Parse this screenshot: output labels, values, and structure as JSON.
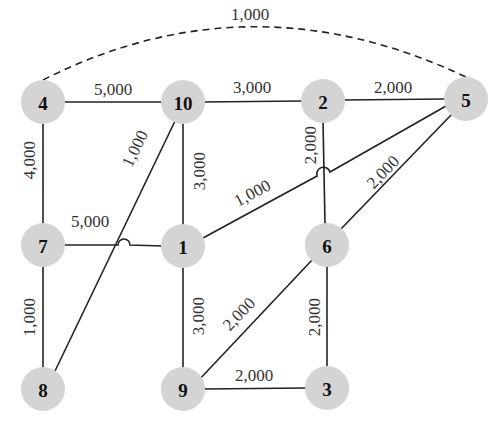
{
  "diagram": {
    "title": "",
    "node_color": "#d4d4d4",
    "nodes": [
      {
        "id": "4",
        "label": "4",
        "x": 43,
        "y": 102
      },
      {
        "id": "10",
        "label": "10",
        "x": 183,
        "y": 102
      },
      {
        "id": "2",
        "label": "2",
        "x": 323,
        "y": 101
      },
      {
        "id": "5",
        "label": "5",
        "x": 466,
        "y": 99
      },
      {
        "id": "7",
        "label": "7",
        "x": 43,
        "y": 245
      },
      {
        "id": "1",
        "label": "1",
        "x": 183,
        "y": 246
      },
      {
        "id": "6",
        "label": "6",
        "x": 327,
        "y": 245
      },
      {
        "id": "8",
        "label": "8",
        "x": 43,
        "y": 389
      },
      {
        "id": "9",
        "label": "9",
        "x": 183,
        "y": 389
      },
      {
        "id": "3",
        "label": "3",
        "x": 327,
        "y": 388
      }
    ],
    "edges": [
      {
        "from": "4",
        "to": "5",
        "weight": "1,000",
        "style": "dashed"
      },
      {
        "from": "4",
        "to": "10",
        "weight": "5,000"
      },
      {
        "from": "10",
        "to": "2",
        "weight": "3,000"
      },
      {
        "from": "2",
        "to": "5",
        "weight": "2,000"
      },
      {
        "from": "4",
        "to": "7",
        "weight": "4,000"
      },
      {
        "from": "10",
        "to": "8",
        "weight": "1,000"
      },
      {
        "from": "10",
        "to": "1",
        "weight": "3,000"
      },
      {
        "from": "2",
        "to": "6",
        "weight": "2,000"
      },
      {
        "from": "1",
        "to": "5",
        "weight": "1,000"
      },
      {
        "from": "6",
        "to": "5",
        "weight": "2,000"
      },
      {
        "from": "7",
        "to": "1",
        "weight": "5,000"
      },
      {
        "from": "7",
        "to": "8",
        "weight": "1,000"
      },
      {
        "from": "1",
        "to": "9",
        "weight": "3,000"
      },
      {
        "from": "9",
        "to": "6",
        "weight": "2,000"
      },
      {
        "from": "6",
        "to": "3",
        "weight": "2,000"
      },
      {
        "from": "9",
        "to": "3",
        "weight": "2,000"
      }
    ]
  }
}
